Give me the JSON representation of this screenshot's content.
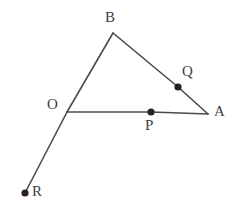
{
  "figure": {
    "canvas": {
      "width": 239,
      "height": 211,
      "background": "#ffffff"
    },
    "style": {
      "stroke_color": "#4a4a52",
      "stroke_width": 1.6,
      "dot_color": "#2b1f22",
      "dot_radius": 3.6,
      "label_color": "#3d3d45",
      "label_font_size": 15
    },
    "points": [
      {
        "id": "B",
        "label": "B",
        "x": 113,
        "y": 33,
        "has_dot": false,
        "label_x": 105,
        "label_y": 10
      },
      {
        "id": "Q",
        "label": "Q",
        "x": 178,
        "y": 87,
        "has_dot": true,
        "label_x": 182,
        "label_y": 64
      },
      {
        "id": "A",
        "label": "A",
        "x": 208,
        "y": 114,
        "has_dot": false,
        "label_x": 214,
        "label_y": 104
      },
      {
        "id": "O",
        "label": "O",
        "x": 67,
        "y": 112,
        "has_dot": false,
        "label_x": 47,
        "label_y": 97
      },
      {
        "id": "P",
        "label": "P",
        "x": 151,
        "y": 112,
        "has_dot": true,
        "label_x": 145,
        "label_y": 118
      },
      {
        "id": "R",
        "label": "R",
        "x": 25,
        "y": 193,
        "has_dot": true,
        "label_x": 32,
        "label_y": 184
      }
    ],
    "segments": [
      {
        "id": "segment-B-R",
        "name": "line-through-B-O-R",
        "from": "B",
        "to": "R",
        "passes_through": [
          "O"
        ]
      },
      {
        "id": "segment-B-A",
        "name": "line-B-to-A",
        "from": "B",
        "to": "A",
        "passes_through": [
          "Q"
        ]
      },
      {
        "id": "segment-O-A",
        "name": "line-O-to-A",
        "from": "O",
        "to": "A",
        "passes_through": [
          "P"
        ]
      }
    ]
  }
}
